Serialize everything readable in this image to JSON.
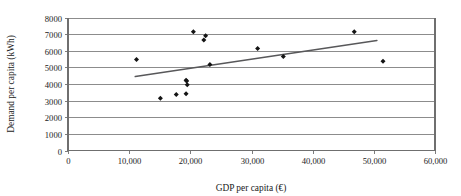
{
  "chart_data": {
    "type": "scatter",
    "title": "",
    "xlabel": "GDP per capita (€)",
    "ylabel": "Demand per capita (kWh)",
    "xlim": [
      0,
      60000
    ],
    "ylim": [
      0,
      8000
    ],
    "grid": true,
    "grid_axis": "y",
    "legend": "none",
    "x_ticks": [
      0,
      10000,
      20000,
      30000,
      40000,
      50000,
      60000
    ],
    "x_tick_labels": [
      "0",
      "10,000",
      "20,000",
      "30,000",
      "40,000",
      "50,000",
      "60,000"
    ],
    "y_ticks": [
      0,
      1000,
      2000,
      3000,
      4000,
      5000,
      6000,
      7000,
      8000
    ],
    "y_tick_labels": [
      "0",
      "1000",
      "2000",
      "3000",
      "4000",
      "5000",
      "6000",
      "7000",
      "8000"
    ],
    "series": [
      {
        "name": "Countries",
        "marker": "diamond",
        "color": "#141414",
        "points": [
          {
            "x": 11200,
            "y": 5480
          },
          {
            "x": 15100,
            "y": 3150
          },
          {
            "x": 17700,
            "y": 3370
          },
          {
            "x": 19300,
            "y": 3420
          },
          {
            "x": 19300,
            "y": 4230
          },
          {
            "x": 19400,
            "y": 4180
          },
          {
            "x": 19500,
            "y": 3960
          },
          {
            "x": 20500,
            "y": 7150
          },
          {
            "x": 22200,
            "y": 6650
          },
          {
            "x": 22500,
            "y": 6900
          },
          {
            "x": 23200,
            "y": 5170
          },
          {
            "x": 31000,
            "y": 6130
          },
          {
            "x": 35200,
            "y": 5660
          },
          {
            "x": 46800,
            "y": 7150
          },
          {
            "x": 51500,
            "y": 5370
          }
        ]
      }
    ],
    "trendline": {
      "name": "linear-fit",
      "color": "#58585a",
      "x0": 11000,
      "y0": 4450,
      "x1": 50500,
      "y1": 6620
    }
  }
}
